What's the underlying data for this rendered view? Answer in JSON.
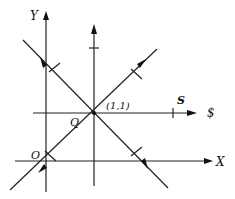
{
  "diagram": {
    "labels": {
      "y_axis": "Y",
      "x_axis": "X",
      "origin": "O",
      "point_q": "Q",
      "point_coord": "(1,1)",
      "s_line_label": "S",
      "s_axis_label": "$"
    },
    "elements": [
      {
        "id": "y-axis",
        "kind": "axis",
        "direction": "up"
      },
      {
        "id": "x-axis",
        "kind": "axis",
        "direction": "right"
      },
      {
        "id": "vertical-line-through-q",
        "kind": "line",
        "direction": "up"
      },
      {
        "id": "horizontal-line-through-q",
        "kind": "line",
        "direction": "right"
      },
      {
        "id": "diagonal-ascending",
        "kind": "line",
        "direction": "down-left and up-right"
      },
      {
        "id": "diagonal-descending",
        "kind": "line",
        "direction": "up-left and down-right"
      }
    ],
    "colors": {
      "ink": "#222222",
      "background": "#ffffff"
    }
  }
}
